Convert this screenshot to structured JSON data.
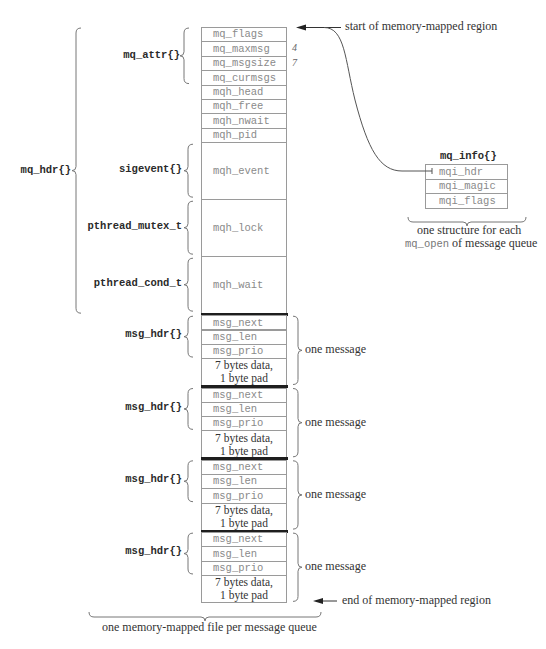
{
  "diagram": {
    "mq_hdr_label": "mq_hdr{}",
    "header_fields": {
      "mq_attr_label": "mq_attr{}",
      "rows": [
        {
          "name": "mq_flags",
          "annotation": ""
        },
        {
          "name": "mq_maxmsg",
          "annotation": "4"
        },
        {
          "name": "mq_msgsize",
          "annotation": "7"
        },
        {
          "name": "mq_curmsgs",
          "annotation": ""
        },
        {
          "name": "mqh_head",
          "annotation": ""
        },
        {
          "name": "mqh_free",
          "annotation": ""
        },
        {
          "name": "mqh_nwait",
          "annotation": ""
        },
        {
          "name": "mqh_pid",
          "annotation": ""
        }
      ]
    },
    "big_fields": [
      {
        "type_label": "sigevent{}",
        "name": "mqh_event"
      },
      {
        "type_label": "pthread_mutex_t",
        "name": "mqh_lock"
      },
      {
        "type_label": "pthread_cond_t",
        "name": "mqh_wait"
      }
    ],
    "messages": [
      {
        "type_label": "msg_hdr{}",
        "fields": [
          "msg_next",
          "msg_len",
          "msg_prio"
        ],
        "data": "7 bytes data,\n1 byte pad",
        "brace_label": "one message"
      },
      {
        "type_label": "msg_hdr{}",
        "fields": [
          "msg_next",
          "msg_len",
          "msg_prio"
        ],
        "data": "7 bytes data,\n1 byte pad",
        "brace_label": "one message"
      },
      {
        "type_label": "msg_hdr{}",
        "fields": [
          "msg_next",
          "msg_len",
          "msg_prio"
        ],
        "data": "7 bytes data,\n1 byte pad",
        "brace_label": "one message"
      },
      {
        "type_label": "msg_hdr{}",
        "fields": [
          "msg_next",
          "msg_len",
          "msg_prio"
        ],
        "data": "7 bytes data,\n1 byte pad",
        "brace_label": "one message"
      }
    ],
    "start_label": "start of memory-mapped region",
    "end_label": "end of memory-mapped region",
    "bottom_label": "one memory-mapped file per message queue",
    "mq_info": {
      "title": "mq_info{}",
      "rows": [
        "mqi_hdr",
        "mqi_magic",
        "mqi_flags"
      ],
      "caption_line1": "one structure for each",
      "caption_line2_code": "mq_open",
      "caption_line2_rest": " of message queue"
    },
    "colors": {
      "border": "#9a9a9a",
      "thick_separator": "#1e1e1e",
      "field_text": "#8a8a8a",
      "label_text": "#2a2a2a"
    }
  }
}
